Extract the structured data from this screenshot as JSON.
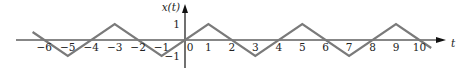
{
  "chart_data": {
    "type": "line",
    "title": "",
    "xlabel": "t",
    "ylabel": "x(t)",
    "x_ticks": [
      -6,
      -5,
      -4,
      -3,
      -2,
      -1,
      0,
      1,
      2,
      3,
      4,
      5,
      6,
      7,
      8,
      9,
      10
    ],
    "y_ticks": [
      1,
      -1
    ],
    "xlim": [
      -6.5,
      10.5
    ],
    "ylim": [
      -1,
      1
    ],
    "grid": false,
    "legend": null,
    "series": [
      {
        "name": "x(t)",
        "description": "periodic triangle wave, period 4, x(0)=0, peak 1 at t=1+4k, trough -1 at t=3+4k",
        "x": [
          -6.5,
          -5,
          -3,
          -1,
          1,
          3,
          5,
          7,
          9,
          10.5
        ],
        "y": [
          0.5,
          -1,
          1,
          -1,
          1,
          -1,
          1,
          -1,
          1,
          -0.5
        ],
        "color": "#7a7a7a"
      }
    ]
  },
  "axis_color": "#111111"
}
